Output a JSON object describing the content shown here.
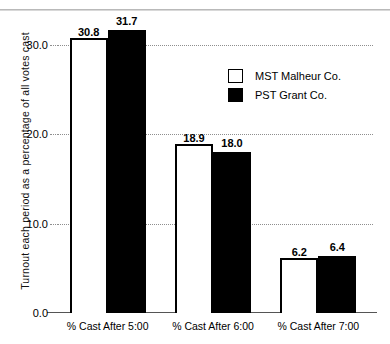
{
  "chart_data": {
    "type": "bar",
    "title": "",
    "xlabel": "",
    "ylabel": "Turnout each period as a percentage of all votes cast",
    "categories": [
      "% Cast After 5:00",
      "% Cast After 6:00",
      "% Cast After 7:00"
    ],
    "series": [
      {
        "name": "MST Malheur Co.",
        "color": "#ffffff",
        "values": [
          30.8,
          18.9,
          6.2
        ]
      },
      {
        "name": "PST Grant Co.",
        "color": "#000000",
        "values": [
          31.7,
          18.0,
          6.4
        ]
      }
    ],
    "ylim": [
      0.0,
      33.5
    ],
    "yticks": [
      "0.0",
      "10.0",
      "20.0",
      "30.0"
    ],
    "ytick_values": [
      0.0,
      10.0,
      20.0,
      30.0
    ],
    "grid": "horizontal-dotted",
    "legend_position": "upper-right",
    "value_labels": [
      [
        "30.8",
        "31.7"
      ],
      [
        "18.9",
        "18.0"
      ],
      [
        "6.2",
        "6.4"
      ]
    ]
  },
  "legend": {
    "items": [
      {
        "label": "MST Malheur Co.",
        "swatch": "white"
      },
      {
        "label": "PST Grant Co.",
        "swatch": "black"
      }
    ]
  }
}
